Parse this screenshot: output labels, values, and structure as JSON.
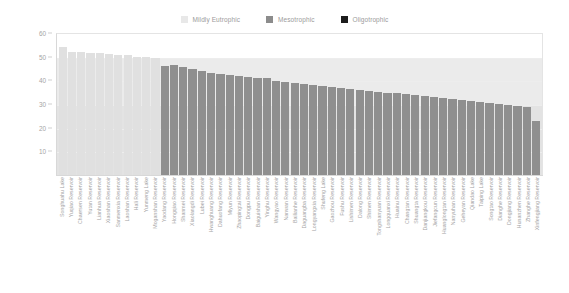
{
  "chart_data": {
    "type": "bar",
    "title": "",
    "xlabel": "",
    "ylabel": "Comprehensive Trophic State Index",
    "ylim": [
      0,
      60
    ],
    "yticks": [
      10,
      20,
      30,
      40,
      50,
      60
    ],
    "grid": true,
    "legend_position": "top-center",
    "legend": [
      {
        "label": "Mildly Eutrophic",
        "color": "#e8e8e8"
      },
      {
        "label": "Mesotrophic",
        "color": "#8c8c8c"
      },
      {
        "label": "Oligotrophic",
        "color": "#1c1c1c"
      }
    ],
    "bands": [
      {
        "label": "Mildly Eutrophic",
        "from": 50,
        "to": 60,
        "color": "#ffffff"
      },
      {
        "label": "Mesotrophic",
        "from": 30,
        "to": 50,
        "color": "#ebebeb"
      },
      {
        "label": "Oligotrophic",
        "from": 0,
        "to": 30,
        "color": "#e3e3e3"
      }
    ],
    "categories": [
      "Songhuahu Lake",
      "Yuqiao Reservoir",
      "Chaersen Reservoir",
      "Yutan Reservoir",
      "Lianhua Reservoir",
      "Xiaoshan Reservoir",
      "Sanmenxia Reservoir",
      "Laoshan Reservoir",
      "Hali Reservoir",
      "Yunmeng Lake",
      "Moganshan Reservoir",
      "Yaodang Reservoir",
      "Hongqiao Reservoir",
      "Shanmei Reservoir",
      "Xiaolangdi Reservoir",
      "Lubei Reservoir",
      "Hwanghuang Reservoir",
      "Dahuofang Reservoir",
      "Miyun Reservoir",
      "Zhaopingtai Reservoir",
      "Dongpu Reservoir",
      "Baiguishan Reservoir",
      "Yinghu Reservoir",
      "Wangyao Reservoir",
      "Nanwan Reservoir",
      "Bailianhe Reservoir",
      "Daguangba Reservoir",
      "Longyangxia Reservoir",
      "Shufeng Lake",
      "Gaozhou Reservoir",
      "Fushu Reservoir",
      "Lishimen Reservoir",
      "Dalong Reservoir",
      "Shimen Reservoir",
      "Tongshanyuan Reservoir",
      "Longquanxi Reservoir",
      "Huainu Reservoir",
      "Changtan Reservoir",
      "Shuangta Reservoir",
      "Danjiangkou Reservoir",
      "Jiefangcun Reservoir",
      "Huanglongtan Reservoir",
      "Nanyuhan Reservoir",
      "Geheyan Reservoir",
      "Qiandao Lake",
      "Taiping Lake",
      "Songtao Reservoir",
      "Dianghe Reservoir",
      "Dongjiang Reservoir",
      "Hunanzhen Reservoir",
      "Zhanghe Reservoir",
      "Xinfengjiang Reservoir"
    ],
    "values": [
      54.0,
      52.0,
      51.8,
      51.6,
      51.4,
      51.2,
      50.8,
      50.5,
      50.0,
      49.9,
      49.5,
      46.0,
      46.3,
      45.6,
      44.7,
      44.0,
      43.2,
      42.6,
      42.2,
      41.7,
      41.3,
      41.2,
      41.0,
      39.6,
      39.2,
      38.8,
      38.3,
      38.0,
      37.6,
      37.2,
      36.8,
      36.4,
      36.0,
      35.6,
      35.2,
      34.8,
      34.5,
      34.1,
      33.7,
      33.3,
      33.0,
      32.6,
      32.2,
      31.8,
      31.3,
      30.8,
      30.3,
      30.0,
      29.5,
      29.2,
      28.7,
      23.0
    ],
    "categories_class": [
      "mildly-eutrophic",
      "mildly-eutrophic",
      "mildly-eutrophic",
      "mildly-eutrophic",
      "mildly-eutrophic",
      "mildly-eutrophic",
      "mildly-eutrophic",
      "mildly-eutrophic",
      "mildly-eutrophic",
      "mildly-eutrophic",
      "mildly-eutrophic",
      "mesotrophic",
      "mesotrophic",
      "mesotrophic",
      "mesotrophic",
      "mesotrophic",
      "mesotrophic",
      "mesotrophic",
      "mesotrophic",
      "mesotrophic",
      "mesotrophic",
      "mesotrophic",
      "mesotrophic",
      "mesotrophic",
      "mesotrophic",
      "mesotrophic",
      "mesotrophic",
      "mesotrophic",
      "mesotrophic",
      "mesotrophic",
      "mesotrophic",
      "mesotrophic",
      "mesotrophic",
      "mesotrophic",
      "mesotrophic",
      "mesotrophic",
      "mesotrophic",
      "mesotrophic",
      "mesotrophic",
      "mesotrophic",
      "mesotrophic",
      "mesotrophic",
      "mesotrophic",
      "mesotrophic",
      "mesotrophic",
      "mesotrophic",
      "mesotrophic",
      "mesotrophic",
      "mesotrophic",
      "mesotrophic",
      "mesotrophic",
      "mesotrophic"
    ]
  }
}
